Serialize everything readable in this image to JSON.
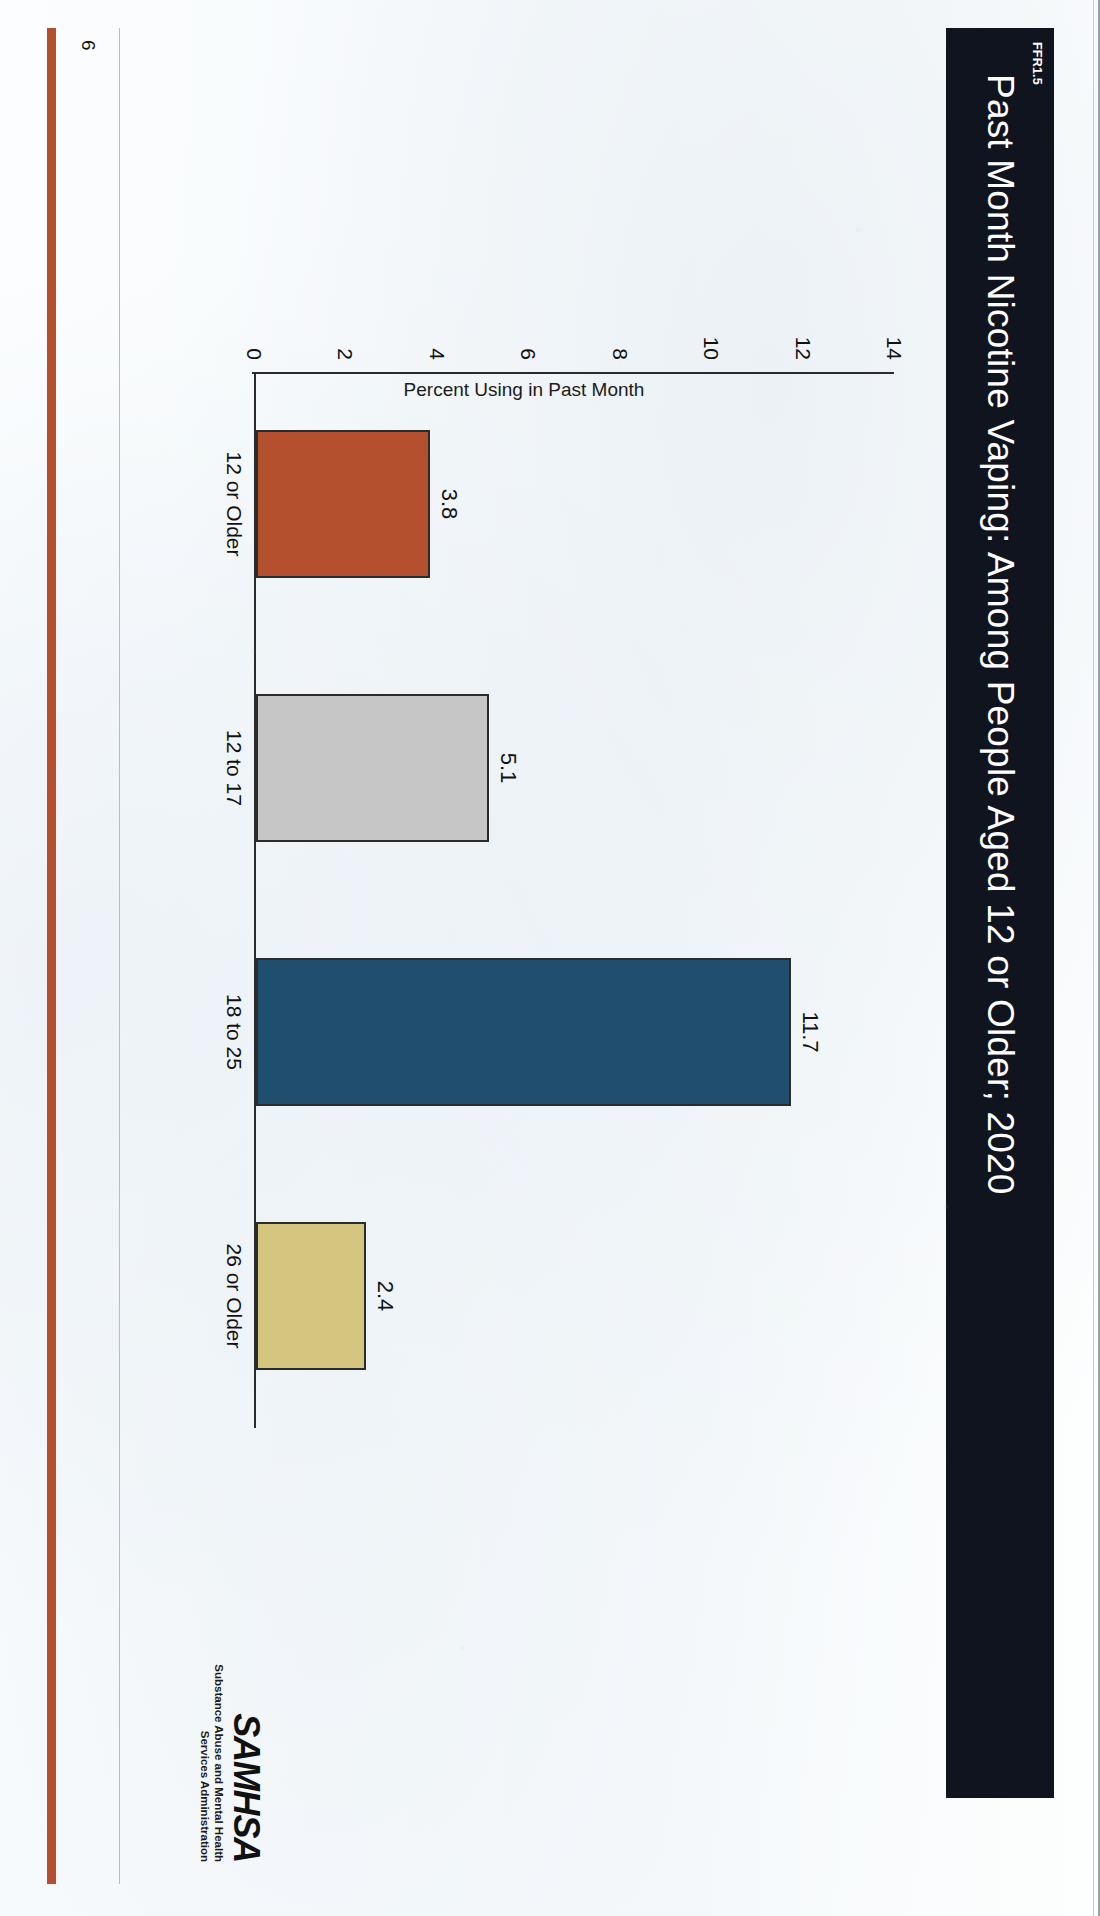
{
  "slide": {
    "code": "FFR1.5",
    "title": "Past Month Nicotine Vaping: Among People Aged 12 or Older; 2020",
    "page_number": "6",
    "banner_color": "#10141f",
    "accent_color": "#b5502f"
  },
  "logo": {
    "wordmark": "SAMHSA",
    "tagline_line1": "Substance Abuse and Mental Health",
    "tagline_line2": "Services Administration"
  },
  "chart_data": {
    "type": "bar",
    "title": "Past Month Nicotine Vaping: Among People Aged 12 or Older; 2020",
    "categories": [
      "12 or Older",
      "12 to 17",
      "18 to 25",
      "26 or Older"
    ],
    "values": [
      3.8,
      5.1,
      11.7,
      2.4
    ],
    "data_labels": [
      "3.8",
      "5.1",
      "11.7",
      "2.4"
    ],
    "bar_colors": [
      "#b5502f",
      "#c6c6c6",
      "#1f4e6e",
      "#d4c67e"
    ],
    "bar_border_color": "#2b2b2b",
    "xlabel": "",
    "ylabel": "Percent Using in Past Month",
    "ylim": [
      0,
      14
    ],
    "yticks": [
      0,
      2,
      4,
      6,
      8,
      10,
      12,
      14
    ],
    "ytick_labels": [
      "0",
      "2",
      "4",
      "6",
      "8",
      "10",
      "12",
      "14"
    ],
    "grid": false,
    "legend": false
  }
}
